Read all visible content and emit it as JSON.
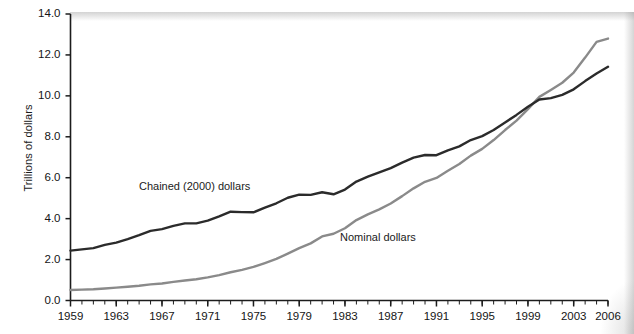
{
  "chart_data": {
    "type": "line",
    "title": "",
    "subtitle": "",
    "xlabel": "",
    "ylabel": "Trillions of dollars",
    "xlim": [
      1959,
      2006
    ],
    "ylim": [
      0.0,
      14.0
    ],
    "grid": false,
    "legend_position": "inline-annotations",
    "y_ticks": [
      "0.0",
      "2.0",
      "4.0",
      "6.0",
      "8.0",
      "10.0",
      "12.0",
      "14.0"
    ],
    "y_tick_values": [
      0.0,
      2.0,
      4.0,
      6.0,
      8.0,
      10.0,
      12.0,
      14.0
    ],
    "x_ticks": [
      "1959",
      "1963",
      "1967",
      "1971",
      "1975",
      "1979",
      "1983",
      "1987",
      "1991",
      "1995",
      "1999",
      "2003",
      "2006"
    ],
    "x_tick_values": [
      1959,
      1963,
      1967,
      1971,
      1975,
      1979,
      1983,
      1987,
      1991,
      1995,
      1999,
      2003,
      2006
    ],
    "x_minor_tick_interval": 1,
    "annotations": [
      {
        "text": "Chained (2000) dollars",
        "series": "Chained (2000) dollars",
        "x": 1966,
        "y": 5.1
      },
      {
        "text": "Nominal dollars",
        "series": "Nominal dollars",
        "x": 1984,
        "y": 2.7
      }
    ],
    "x": [
      1959,
      1960,
      1961,
      1962,
      1963,
      1964,
      1965,
      1966,
      1967,
      1968,
      1969,
      1970,
      1971,
      1972,
      1973,
      1974,
      1975,
      1976,
      1977,
      1978,
      1979,
      1980,
      1981,
      1982,
      1983,
      1984,
      1985,
      1986,
      1987,
      1988,
      1989,
      1990,
      1991,
      1992,
      1993,
      1994,
      1995,
      1996,
      1997,
      1998,
      1999,
      2000,
      2001,
      2002,
      2003,
      2004,
      2005,
      2006
    ],
    "series": [
      {
        "name": "Chained (2000) dollars",
        "color": "#2b2b2b",
        "width_px": 2.4,
        "values": [
          2.44,
          2.5,
          2.56,
          2.72,
          2.83,
          3.0,
          3.19,
          3.4,
          3.49,
          3.65,
          3.77,
          3.77,
          3.9,
          4.11,
          4.34,
          4.32,
          4.31,
          4.54,
          4.75,
          5.02,
          5.17,
          5.16,
          5.29,
          5.19,
          5.42,
          5.81,
          6.05,
          6.26,
          6.47,
          6.74,
          6.98,
          7.11,
          7.1,
          7.34,
          7.53,
          7.84,
          8.03,
          8.33,
          8.7,
          9.07,
          9.47,
          9.82,
          9.89,
          10.05,
          10.32,
          10.72,
          11.09,
          11.42
        ],
        "endpoint_value": 11.6
      },
      {
        "name": "Nominal dollars",
        "color": "#8a8a8a",
        "width_px": 2.4,
        "values": [
          0.51,
          0.53,
          0.55,
          0.59,
          0.63,
          0.67,
          0.72,
          0.79,
          0.83,
          0.91,
          0.98,
          1.04,
          1.13,
          1.24,
          1.38,
          1.5,
          1.64,
          1.83,
          2.03,
          2.29,
          2.56,
          2.79,
          3.13,
          3.26,
          3.53,
          3.93,
          4.21,
          4.45,
          4.74,
          5.1,
          5.48,
          5.8,
          5.99,
          6.34,
          6.67,
          7.08,
          7.41,
          7.84,
          8.33,
          8.79,
          9.35,
          9.95,
          10.29,
          10.64,
          11.14,
          11.87,
          12.64,
          12.8
        ],
        "endpoint_value": 12.8
      }
    ]
  }
}
